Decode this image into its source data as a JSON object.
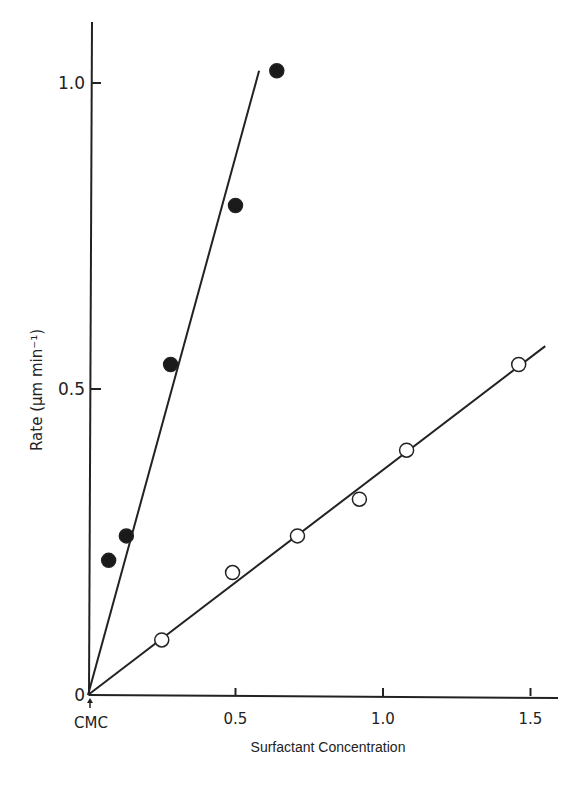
{
  "chart_data": {
    "type": "scatter",
    "title": "",
    "xlabel": "Surfactant Concentration",
    "ylabel": "Rate (μm min⁻¹)",
    "x_tick_labels": [
      "CMC",
      "0.5",
      "1.0",
      "1.5"
    ],
    "x_ticks": [
      0,
      0.5,
      1.0,
      1.5
    ],
    "y_tick_labels": [
      "0",
      "0.5",
      "1.0"
    ],
    "y_ticks": [
      0,
      0.5,
      1.0
    ],
    "xlim": [
      0,
      1.58
    ],
    "ylim": [
      0,
      1.1
    ],
    "grid": false,
    "legend": null,
    "annotations": [
      "CMC (arrow at origin)"
    ],
    "series": [
      {
        "name": "filled circles",
        "marker": "filled-circle",
        "x": [
          0.07,
          0.13,
          0.28,
          0.5,
          0.64
        ],
        "y": [
          0.22,
          0.26,
          0.54,
          0.8,
          1.02
        ],
        "fit_line": {
          "x": [
            0,
            0.58
          ],
          "y": [
            0,
            1.02
          ]
        }
      },
      {
        "name": "open circles",
        "marker": "open-circle",
        "x": [
          0.25,
          0.49,
          0.71,
          0.92,
          1.08,
          1.46
        ],
        "y": [
          0.09,
          0.2,
          0.26,
          0.32,
          0.4,
          0.54
        ],
        "fit_line": {
          "x": [
            0,
            1.55
          ],
          "y": [
            0,
            0.57
          ]
        }
      }
    ]
  }
}
